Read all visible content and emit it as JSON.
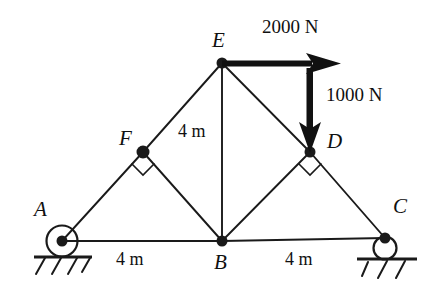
{
  "figure": {
    "type": "truss-free-body-diagram",
    "background_color": "#ffffff",
    "line_color": "#1a1a1a"
  },
  "joints": [
    {
      "id": "A",
      "label": "A",
      "x": 62,
      "y": 241,
      "support": "pin"
    },
    {
      "id": "B",
      "label": "B",
      "x": 222,
      "y": 241,
      "support": "none"
    },
    {
      "id": "C",
      "label": "C",
      "x": 385,
      "y": 238,
      "support": "roller"
    },
    {
      "id": "D",
      "label": "D",
      "x": 310,
      "y": 152,
      "support": "none"
    },
    {
      "id": "E",
      "label": "E",
      "x": 222,
      "y": 63,
      "support": "none"
    },
    {
      "id": "F",
      "label": "F",
      "x": 143,
      "y": 152,
      "support": "none"
    }
  ],
  "members": [
    {
      "from": "A",
      "to": "F"
    },
    {
      "from": "F",
      "to": "E"
    },
    {
      "from": "E",
      "to": "D"
    },
    {
      "from": "D",
      "to": "C"
    },
    {
      "from": "A",
      "to": "B"
    },
    {
      "from": "B",
      "to": "C"
    },
    {
      "from": "E",
      "to": "B"
    },
    {
      "from": "F",
      "to": "B"
    },
    {
      "from": "B",
      "to": "D"
    }
  ],
  "right_angle_markers": [
    {
      "at": "F"
    },
    {
      "at": "D"
    }
  ],
  "dimensions": [
    {
      "id": "span-left",
      "text": "4 m",
      "between": "A-B",
      "orientation": "horizontal"
    },
    {
      "id": "span-right",
      "text": "4 m",
      "between": "B-C",
      "orientation": "horizontal"
    },
    {
      "id": "height",
      "text": "4 m",
      "between": "E-B",
      "orientation": "vertical"
    }
  ],
  "loads": [
    {
      "id": "load-horizontal",
      "text": "2000 N",
      "magnitude": 2000,
      "unit": "N",
      "direction": "right",
      "applied_at": "E"
    },
    {
      "id": "load-vertical",
      "text": "1000 N",
      "magnitude": 1000,
      "unit": "N",
      "direction": "down",
      "applied_at": "D"
    }
  ],
  "supports": [
    {
      "id": "support-A",
      "type": "pin",
      "at": "A"
    },
    {
      "id": "support-C",
      "type": "roller",
      "at": "C"
    }
  ]
}
